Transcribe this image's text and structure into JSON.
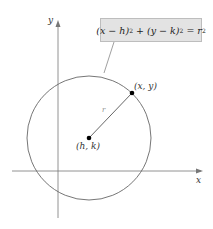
{
  "diagram": {
    "equation": {
      "lhs_a": "(x − h)",
      "exp_a": "2",
      "plus": " + ",
      "lhs_b": "(y − k)",
      "exp_b": "2",
      "equals": " = ",
      "rhs": "r",
      "exp_r": "2"
    },
    "axes": {
      "x_label": "x",
      "y_label": "y"
    },
    "center": {
      "label": "(h, k)"
    },
    "point": {
      "label": "(x, y)"
    },
    "radius": {
      "label": "r"
    },
    "colors": {
      "stroke": "#555555",
      "box_fill": "#e3e3e3",
      "box_border": "#bdbdbd",
      "point": "#000000"
    }
  }
}
